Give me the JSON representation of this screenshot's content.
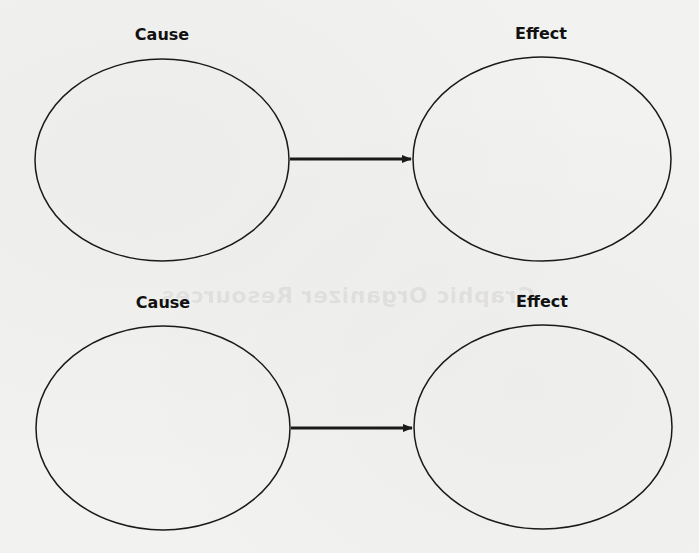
{
  "diagram": {
    "type": "cause-effect graphic organizer",
    "watermark": "Graphic Organizer Resources",
    "rows": [
      {
        "cause": {
          "label": "Cause",
          "content": ""
        },
        "effect": {
          "label": "Effect",
          "content": ""
        }
      },
      {
        "cause": {
          "label": "Cause",
          "content": ""
        },
        "effect": {
          "label": "Effect",
          "content": ""
        }
      }
    ],
    "colors": {
      "stroke": "#1a1a1a",
      "background": "#f2f2f1"
    }
  }
}
